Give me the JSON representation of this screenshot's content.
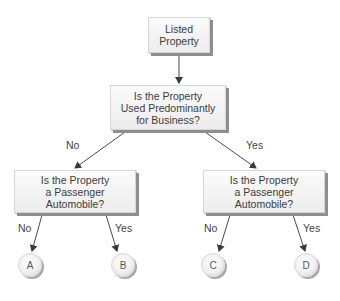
{
  "diagram": {
    "type": "decision-tree",
    "nodes": {
      "root": {
        "label": "Listed\nProperty"
      },
      "business_question": {
        "label": "Is the Property\nUsed Predominantly\nfor Business?"
      },
      "left_question": {
        "label": "Is the Property\na Passenger\nAutomobile?"
      },
      "right_question": {
        "label": "Is the Property\na Passenger\nAutomobile?"
      },
      "outcomes": [
        {
          "id": "A",
          "label": "A"
        },
        {
          "id": "B",
          "label": "B"
        },
        {
          "id": "C",
          "label": "C"
        },
        {
          "id": "D",
          "label": "D"
        }
      ]
    },
    "edges": {
      "business_no": "No",
      "business_yes": "Yes",
      "left_no": "No",
      "left_yes": "Yes",
      "right_no": "No",
      "right_yes": "Yes"
    },
    "colors": {
      "line": "#4a4a4a",
      "box_fill": "#f4f4f4",
      "box_shadow": "#8e8e8e"
    }
  }
}
